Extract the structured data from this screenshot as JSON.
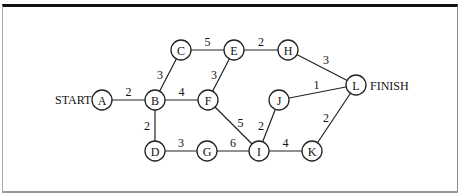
{
  "diagram": {
    "type": "weighted-network",
    "start_label": "START",
    "finish_label": "FINISH",
    "start_node": "A",
    "finish_node": "L",
    "nodes": [
      "A",
      "B",
      "C",
      "D",
      "E",
      "F",
      "G",
      "H",
      "I",
      "J",
      "K",
      "L"
    ],
    "edges": [
      {
        "from": "A",
        "to": "B",
        "weight": "2"
      },
      {
        "from": "B",
        "to": "C",
        "weight": "3"
      },
      {
        "from": "B",
        "to": "F",
        "weight": "4"
      },
      {
        "from": "B",
        "to": "D",
        "weight": "2"
      },
      {
        "from": "C",
        "to": "E",
        "weight": "5"
      },
      {
        "from": "F",
        "to": "E",
        "weight": "3"
      },
      {
        "from": "E",
        "to": "H",
        "weight": "2"
      },
      {
        "from": "H",
        "to": "L",
        "weight": "3"
      },
      {
        "from": "F",
        "to": "I",
        "weight": "5"
      },
      {
        "from": "D",
        "to": "G",
        "weight": "3"
      },
      {
        "from": "G",
        "to": "I",
        "weight": "6"
      },
      {
        "from": "I",
        "to": "J",
        "weight": "2"
      },
      {
        "from": "J",
        "to": "L",
        "weight": "1"
      },
      {
        "from": "I",
        "to": "K",
        "weight": "4"
      },
      {
        "from": "K",
        "to": "L",
        "weight": "2"
      }
    ]
  }
}
